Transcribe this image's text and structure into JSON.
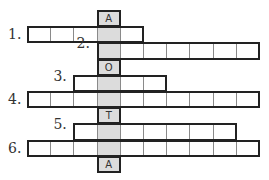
{
  "puzzle": {
    "type": "crossword",
    "key_column": 3,
    "key_word_letters": [
      "A",
      "",
      "",
      "O",
      "",
      "",
      "T",
      "",
      "",
      "A"
    ],
    "colors": {
      "cell_bg": "#ffffff",
      "key_bg": "#dcdcdc",
      "border": "#222222",
      "inner_line": "#8a8a8a"
    },
    "rows": [
      {
        "index": 0,
        "label": "",
        "start": 3,
        "end": 3,
        "key_letter": "A"
      },
      {
        "index": 1,
        "label": "1.",
        "start": 0,
        "end": 4,
        "key_letter": ""
      },
      {
        "index": 2,
        "label": "2.",
        "start": 3,
        "end": 9,
        "key_letter": ""
      },
      {
        "index": 3,
        "label": "",
        "start": 3,
        "end": 3,
        "key_letter": "O"
      },
      {
        "index": 4,
        "label": "3.",
        "start": 2,
        "end": 5,
        "key_letter": ""
      },
      {
        "index": 5,
        "label": "4.",
        "start": 0,
        "end": 9,
        "key_letter": ""
      },
      {
        "index": 6,
        "label": "",
        "start": 3,
        "end": 3,
        "key_letter": "T"
      },
      {
        "index": 7,
        "label": "5.",
        "start": 2,
        "end": 8,
        "key_letter": ""
      },
      {
        "index": 8,
        "label": "6.",
        "start": 0,
        "end": 9,
        "key_letter": ""
      },
      {
        "index": 9,
        "label": "",
        "start": 3,
        "end": 3,
        "key_letter": "A"
      }
    ]
  }
}
